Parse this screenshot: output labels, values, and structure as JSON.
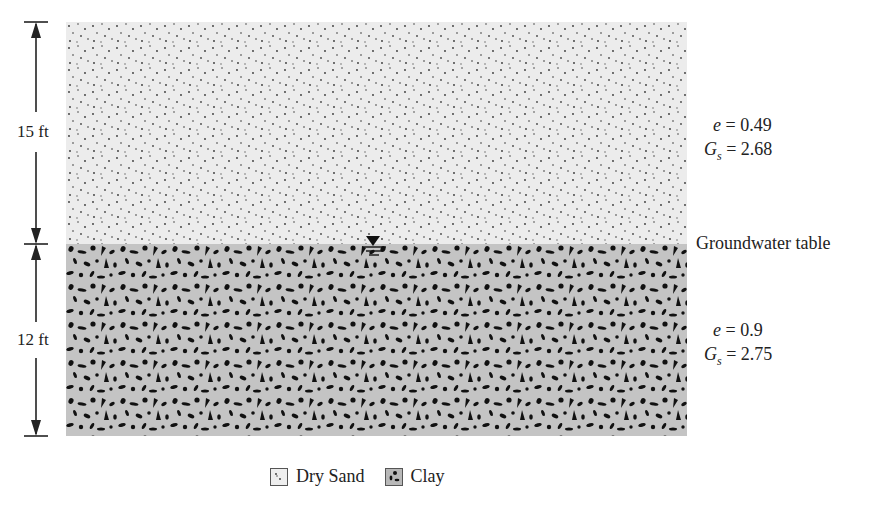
{
  "figure": {
    "layers": [
      {
        "name": "Dry Sand",
        "thickness_label": "15 ft",
        "e_label": "e",
        "e_value": "= 0.49",
        "gs_label": "G",
        "gs_sub": "s",
        "gs_value": "= 2.68",
        "fill_color": "#ececec"
      },
      {
        "name": "Clay",
        "thickness_label": "12 ft",
        "e_label": "e",
        "e_value": "= 0.9",
        "gs_label": "G",
        "gs_sub": "s",
        "gs_value": "= 2.75",
        "fill_color": "#c4c4c4"
      }
    ],
    "groundwater_label": "Groundwater table",
    "legend": [
      {
        "label": "Dry Sand",
        "icon": "sand-swatch-icon"
      },
      {
        "label": "Clay",
        "icon": "clay-swatch-icon"
      }
    ]
  }
}
